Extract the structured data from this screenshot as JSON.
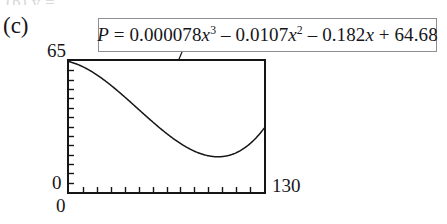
{
  "figure": {
    "part_label": "(c)",
    "top_remnant": "(b)  y =",
    "equation": {
      "lhs": "P",
      "eq_sign": "=",
      "full_text": "P = 0.000078x^3 - 0.0107x^2 - 0.182x + 64.68",
      "terms": [
        {
          "coefficient": "0.000078",
          "variable": "x",
          "exponent": "3",
          "sign": ""
        },
        {
          "coefficient": "0.0107",
          "variable": "x",
          "exponent": "2",
          "sign": "–"
        },
        {
          "coefficient": "0.182",
          "variable": "x",
          "exponent": "",
          "sign": "–"
        },
        {
          "coefficient": "64.68",
          "variable": "",
          "exponent": "",
          "sign": "+"
        }
      ]
    },
    "axes": {
      "y_max_label": "65",
      "y_min_label": "0",
      "x_max_label": "130",
      "x_min_label": "0"
    },
    "colors": {
      "frame": "#151518",
      "curve": "#16161a",
      "box_border": "#8d8d93",
      "text": "#16161a",
      "background": "#ffffff"
    }
  },
  "chart_data": {
    "type": "line",
    "title": "",
    "subtitle": "",
    "xlabel": "",
    "ylabel": "",
    "xlim": [
      0,
      130
    ],
    "ylim": [
      0,
      65
    ],
    "grid": false,
    "legend": null,
    "x_ticks_count": 13,
    "y_ticks_count": 13,
    "annotations": [
      {
        "text": "P = 0.000078x^3 - 0.0107x^2 - 0.182x + 64.68",
        "kind": "equation-callout-box",
        "leader_from": [
          182,
          52
        ],
        "leader_to": [
          152,
          124
        ]
      }
    ],
    "equation": {
      "a3": 7.8e-05,
      "a2": -0.0107,
      "a1": -0.182,
      "a0": 64.68
    },
    "series": [
      {
        "name": "P(x)",
        "x": [
          0,
          5,
          10,
          15,
          20,
          25,
          30,
          35,
          40,
          45,
          50,
          55,
          60,
          65,
          70,
          75,
          80,
          85,
          90,
          95,
          100,
          105,
          110,
          115,
          120,
          125,
          130
        ],
        "values": [
          64.68,
          63.5,
          62.0,
          60.2,
          58.2,
          56.0,
          53.7,
          51.3,
          48.9,
          46.5,
          44.2,
          42.0,
          40.0,
          38.2,
          36.6,
          35.4,
          34.5,
          34.1,
          34.1,
          34.6,
          35.7,
          37.4,
          39.8,
          42.9,
          46.8,
          51.5,
          57.0
        ]
      }
    ]
  }
}
